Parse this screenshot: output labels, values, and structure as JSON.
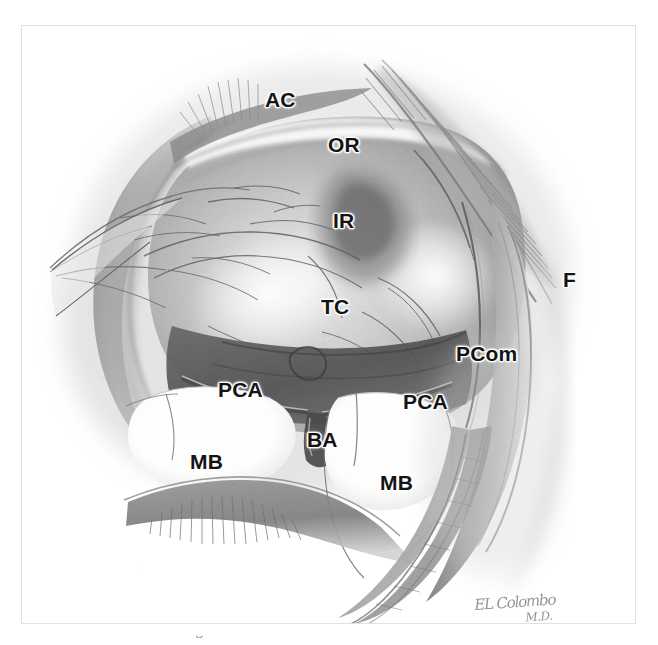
{
  "figure": {
    "kind": "anatomical-pencil-illustration",
    "medium": "graphite pencil drawing",
    "background_color": "#ffffff",
    "frame_color": "#e2e2e2",
    "label_color": "#141414",
    "label_halo_color": "#ffffff"
  },
  "labels": [
    {
      "id": "ac",
      "text": "AC",
      "x": 243,
      "y": 63,
      "size": 21,
      "name": "label-ac"
    },
    {
      "id": "or",
      "text": "OR",
      "x": 306,
      "y": 108,
      "size": 21,
      "name": "label-or"
    },
    {
      "id": "ir",
      "text": "IR",
      "x": 311,
      "y": 184,
      "size": 21,
      "name": "label-ir"
    },
    {
      "id": "f",
      "text": "F",
      "x": 541,
      "y": 243,
      "size": 21,
      "name": "label-f"
    },
    {
      "id": "tc",
      "text": "TC",
      "x": 299,
      "y": 270,
      "size": 21,
      "name": "label-tc"
    },
    {
      "id": "pcom",
      "text": "PCom",
      "x": 434,
      "y": 317,
      "size": 21,
      "name": "label-pcom"
    },
    {
      "id": "pca-left",
      "text": "PCA",
      "x": 196,
      "y": 353,
      "size": 21,
      "name": "label-pca-left"
    },
    {
      "id": "pca-right",
      "text": "PCA",
      "x": 381,
      "y": 365,
      "size": 21,
      "name": "label-pca-right"
    },
    {
      "id": "ba",
      "text": "BA",
      "x": 285,
      "y": 403,
      "size": 21,
      "name": "label-ba"
    },
    {
      "id": "mb-left",
      "text": "MB",
      "x": 168,
      "y": 425,
      "size": 21,
      "name": "label-mb-left"
    },
    {
      "id": "mb-right",
      "text": "MB",
      "x": 358,
      "y": 446,
      "size": 21,
      "name": "label-mb-right"
    }
  ],
  "legend_meaning": {
    "AC": "Anterior Clinoid / arachnoid of carotid cistern",
    "OR": "Optic Radiation / optic nerve region",
    "IR": "Infundibular Recess",
    "TC": "Tuber Cinereum",
    "F": "Frontal lobe retracted",
    "PCom": "Posterior Communicating artery",
    "PCA": "Posterior Cerebral Artery",
    "BA": "Basilar Artery",
    "MB": "Mammillary Body"
  },
  "signature": {
    "line1": "EL Colombo",
    "line2": "M.D.",
    "x": 452,
    "y": 572,
    "color": "#8b8d92"
  },
  "caption": {
    "text": "of the figure of the internal cerebral structures"
  }
}
